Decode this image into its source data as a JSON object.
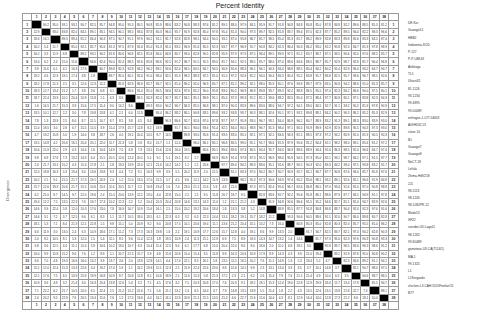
{
  "chart_data": {
    "type": "table",
    "title": "Percent Identity",
    "ylabel": "Divergence",
    "n": 38,
    "column_numbers": [
      1,
      2,
      3,
      4,
      5,
      6,
      7,
      8,
      9,
      10,
      11,
      12,
      13,
      14,
      15,
      16,
      17,
      18,
      19,
      20,
      21,
      22,
      23,
      24,
      25,
      26,
      27,
      28,
      29,
      30,
      31,
      32,
      33,
      34,
      35,
      36,
      37,
      38
    ],
    "sequence_labels": [
      "DE-Kor",
      "Guangxi11",
      "HBB2",
      "Indonesia-KOD",
      "P-127",
      "P-P-LBK43",
      "Ankhogo",
      "TL1",
      "Ulsan4/1",
      "81-1126",
      "93-1234",
      "99-4895",
      "99-00089",
      "enfrogus-1-O/T-54653",
      "AG/HD3C13",
      "clone 10",
      "B1",
      "Guangxi7",
      "Guangxi8",
      "NeCT-18",
      "Lefufa",
      "Zhima-HdV218",
      "2J1",
      "98-1113",
      "98-1245",
      "98-1081PR-12",
      "Medo13",
      "SF22",
      "cenobe-UII-Lago11",
      "98-1262",
      "99-80489",
      "gametwia-UII-CA(7114/1)",
      "MA-1",
      "99-1325",
      "L1",
      "L1Sergardo",
      "chicken-LII-CAH-5515Fonfan/11",
      "B77"
    ]
  }
}
